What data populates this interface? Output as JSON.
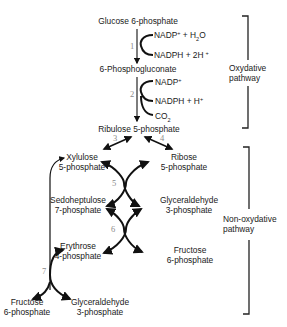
{
  "compounds": {
    "glucose_6p": "Glucose 6-phosphate",
    "phosphogluconate": "6-Phosphogluconate",
    "ribulose_5p": "Ribulose 5-phosphate",
    "xylulose_5p": [
      "Xylulose",
      "5-phosphate"
    ],
    "ribose_5p": [
      "Ribose",
      "5-phosphate"
    ],
    "sedoheptulose_7p": [
      "Sedoheptulose",
      "7-phosphate"
    ],
    "glyceraldehyde_3p_mid": [
      "Glyceraldehyde",
      "3-phosphate"
    ],
    "erythrose_4p": [
      "Erythrose",
      "4-phosphate"
    ],
    "fructose_6p_mid": [
      "Fructose",
      "6-phosphate"
    ],
    "fructose_6p_bottom": [
      "Fructose",
      "6-phosphate"
    ],
    "glyceraldehyde_3p_bottom": [
      "Glyceraldehyde",
      "3-phosphate"
    ]
  },
  "cofactors": {
    "step1_in": {
      "base": "NADP",
      "sup": "+",
      "rest": " + H",
      "sub": "2",
      "tail": "O"
    },
    "step1_out": {
      "base": "NADPH + 2H",
      "sup": "+"
    },
    "step2_in": {
      "base": "NADP",
      "sup": "+"
    },
    "step2_out": {
      "base": "NADPH + H",
      "sup": "+"
    },
    "step2_co2": {
      "base": "CO",
      "sub": "2"
    }
  },
  "steps": [
    "1",
    "2",
    "3",
    "4",
    "5",
    "6",
    "7"
  ],
  "pathways": {
    "oxydative": [
      "Oxydative",
      "pathway"
    ],
    "non_oxydative": [
      "Non-oxydative",
      "pathway"
    ]
  }
}
